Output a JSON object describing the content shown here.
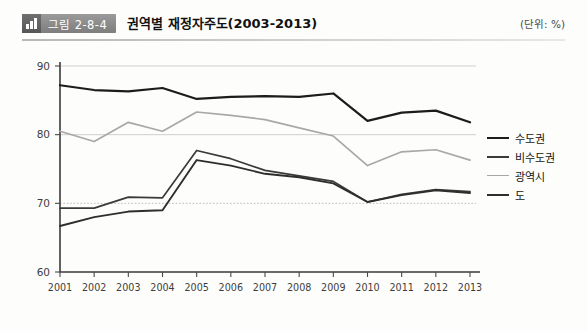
{
  "header": {
    "badge_label": "그림 2-8-4",
    "badge_icon": "bar-chart-icon",
    "title": "권역별 재정자주도(2003-2013)",
    "unit": "(단위: %)"
  },
  "chart_data": {
    "type": "line",
    "title": "권역별 재정자주도(2003-2013)",
    "xlabel": "",
    "ylabel": "",
    "unit": "%",
    "ylim": [
      60,
      90
    ],
    "yticks": [
      60,
      70,
      80,
      90
    ],
    "grid": true,
    "legend_position": "right",
    "categories": [
      "2001",
      "2002",
      "2003",
      "2004",
      "2005",
      "2006",
      "2007",
      "2008",
      "2009",
      "2010",
      "2011",
      "2012",
      "2013"
    ],
    "series": [
      {
        "name": "수도권",
        "color": "#1c1c1c",
        "width": 2.2,
        "values": [
          87.2,
          86.5,
          86.3,
          86.8,
          85.2,
          85.5,
          85.6,
          85.5,
          86.0,
          82.0,
          83.2,
          83.5,
          81.8
        ]
      },
      {
        "name": "비수도권",
        "color": "#3a3a3a",
        "width": 1.7,
        "values": [
          69.3,
          69.3,
          70.9,
          70.8,
          77.7,
          76.5,
          74.8,
          74.0,
          73.2,
          70.2,
          71.3,
          72.0,
          71.7
        ]
      },
      {
        "name": "광역시",
        "color": "#a8a8a8",
        "width": 1.7,
        "values": [
          80.5,
          79.0,
          81.8,
          80.5,
          83.3,
          82.8,
          82.2,
          81.0,
          79.8,
          75.5,
          77.5,
          77.8,
          76.3
        ]
      },
      {
        "name": "도",
        "color": "#2e2e2e",
        "width": 1.9,
        "values": [
          66.7,
          68.0,
          68.8,
          69.0,
          76.3,
          75.5,
          74.3,
          73.8,
          72.9,
          70.2,
          71.2,
          71.9,
          71.5
        ]
      }
    ]
  },
  "legend": {
    "items": [
      {
        "label": "수도권",
        "color": "#1c1c1c",
        "width": 2.6
      },
      {
        "label": "비수도권",
        "color": "#3a3a3a",
        "width": 2.4
      },
      {
        "label": "광역시",
        "color": "#a8a8a8",
        "width": 1.8
      },
      {
        "label": "도",
        "color": "#2e2e2e",
        "width": 2.6
      }
    ]
  }
}
